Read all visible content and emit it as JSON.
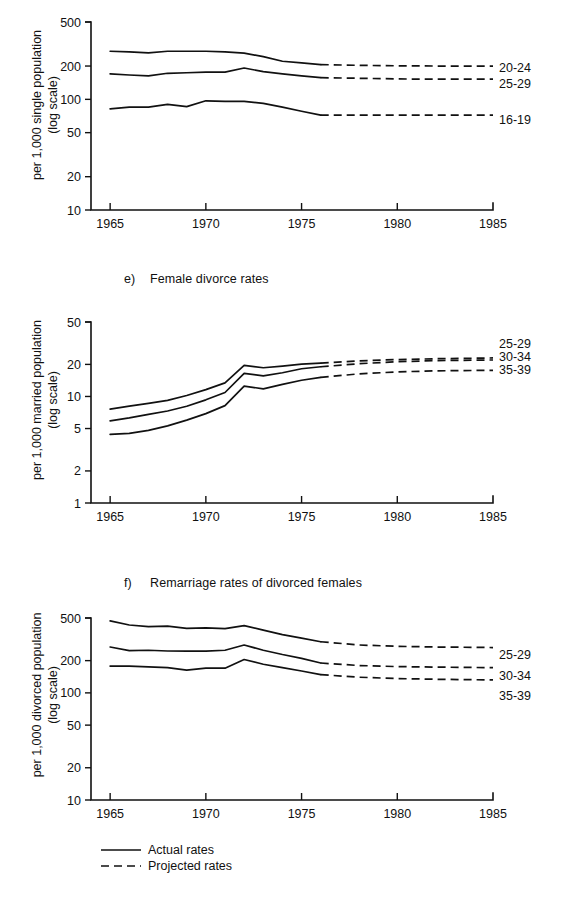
{
  "figure": {
    "background": "#ffffff",
    "ink_color": "#111111"
  },
  "panels": [
    {
      "marker": "",
      "title": "",
      "ylabel_line1": "per 1,000 single population",
      "ylabel_line2": "(log scale)"
    },
    {
      "marker": "e)",
      "title": "Female divorce rates",
      "ylabel_line1": "per 1,000 married population",
      "ylabel_line2": "(log scale)"
    },
    {
      "marker": "f)",
      "title": "Remarriage rates of divorced females",
      "ylabel_line1": "per 1,000 divorced population",
      "ylabel_line2": "(log scale)"
    }
  ],
  "legend": {
    "items": [
      {
        "label": "Actual rates",
        "style": "solid"
      },
      {
        "label": "Projected rates",
        "style": "dashed"
      }
    ]
  },
  "chart_data": [
    {
      "type": "line",
      "title": "",
      "xlabel": "",
      "ylabel": "per 1,000 single population (log scale)",
      "log_y": true,
      "ylim": [
        10,
        500
      ],
      "yticks": [
        10,
        20,
        50,
        100,
        200,
        500
      ],
      "ytick_labels": [
        "10",
        "20",
        "50",
        "100",
        "200",
        "500"
      ],
      "xlim": [
        1964,
        1985
      ],
      "xticks": [
        1965,
        1970,
        1975,
        1980,
        1985
      ],
      "xtick_labels": [
        "1965",
        "1970",
        "1975",
        "1980",
        "1985"
      ],
      "grid": false,
      "legend_position": "right-of-series",
      "split_year": 1976,
      "series": [
        {
          "name": "20-24",
          "x": [
            1965,
            1966,
            1967,
            1968,
            1969,
            1970,
            1971,
            1972,
            1973,
            1974,
            1975,
            1976
          ],
          "values": [
            272,
            268,
            263,
            272,
            272,
            272,
            268,
            262,
            243,
            221,
            214,
            206
          ],
          "projected_x": [
            1976,
            1978,
            1980,
            1982,
            1985
          ],
          "projected_values": [
            206,
            203,
            201,
            200,
            200
          ]
        },
        {
          "name": "25-29",
          "x": [
            1965,
            1966,
            1967,
            1968,
            1969,
            1970,
            1971,
            1972,
            1973,
            1974,
            1975,
            1976
          ],
          "values": [
            170,
            166,
            163,
            172,
            174,
            176,
            176,
            192,
            178,
            170,
            163,
            157
          ],
          "projected_x": [
            1976,
            1978,
            1980,
            1982,
            1985
          ],
          "projected_values": [
            157,
            155,
            153,
            152,
            152
          ]
        },
        {
          "name": "16-19",
          "x": [
            1965,
            1966,
            1967,
            1968,
            1969,
            1970,
            1971,
            1972,
            1973,
            1974,
            1975,
            1976
          ],
          "values": [
            82,
            85,
            85,
            90,
            86,
            97,
            96,
            96,
            92,
            85,
            78,
            72
          ],
          "projected_x": [
            1976,
            1978,
            1980,
            1982,
            1985
          ],
          "projected_values": [
            72,
            72,
            72,
            72,
            72
          ]
        }
      ]
    },
    {
      "type": "line",
      "title": "e) Female divorce rates",
      "xlabel": "",
      "ylabel": "per 1,000 married population (log scale)",
      "log_y": true,
      "ylim": [
        1,
        50
      ],
      "yticks": [
        1,
        2,
        5,
        10,
        20,
        50
      ],
      "ytick_labels": [
        "1",
        "2",
        "5",
        "10",
        "20",
        "50"
      ],
      "xlim": [
        1964,
        1985
      ],
      "xticks": [
        1965,
        1970,
        1975,
        1980,
        1985
      ],
      "xtick_labels": [
        "1965",
        "1970",
        "1975",
        "1980",
        "1985"
      ],
      "grid": false,
      "legend_position": "right-of-series",
      "split_year": 1976,
      "series": [
        {
          "name": "25-29",
          "x": [
            1965,
            1966,
            1967,
            1968,
            1969,
            1970,
            1971,
            1972,
            1973,
            1974,
            1975,
            1976
          ],
          "values": [
            7.6,
            8.1,
            8.6,
            9.2,
            10.2,
            11.6,
            13.4,
            19.6,
            18.6,
            19.3,
            20.1,
            20.6
          ],
          "projected_x": [
            1976,
            1978,
            1980,
            1982,
            1985
          ],
          "projected_values": [
            20.6,
            21.6,
            22.2,
            22.6,
            23.0
          ]
        },
        {
          "name": "30-34",
          "x": [
            1965,
            1966,
            1967,
            1968,
            1969,
            1970,
            1971,
            1972,
            1973,
            1974,
            1975,
            1976
          ],
          "values": [
            5.9,
            6.3,
            6.8,
            7.3,
            8.1,
            9.3,
            10.9,
            16.5,
            15.6,
            16.7,
            18.2,
            19.0
          ],
          "projected_x": [
            1976,
            1978,
            1980,
            1982,
            1985
          ],
          "projected_values": [
            19.0,
            20.3,
            21.2,
            21.7,
            22.0
          ]
        },
        {
          "name": "35-39",
          "x": [
            1965,
            1966,
            1967,
            1968,
            1969,
            1970,
            1971,
            1972,
            1973,
            1974,
            1975,
            1976
          ],
          "values": [
            4.4,
            4.5,
            4.8,
            5.3,
            6.0,
            6.9,
            8.2,
            12.5,
            11.8,
            13.0,
            14.2,
            15.1
          ],
          "projected_x": [
            1976,
            1978,
            1980,
            1982,
            1985
          ],
          "projected_values": [
            15.1,
            16.3,
            17.0,
            17.4,
            17.6
          ]
        }
      ]
    },
    {
      "type": "line",
      "title": "f) Remarriage rates of divorced females",
      "xlabel": "",
      "ylabel": "per 1,000 divorced population (log scale)",
      "log_y": true,
      "ylim": [
        10,
        500
      ],
      "yticks": [
        10,
        20,
        50,
        100,
        200,
        500
      ],
      "ytick_labels": [
        "10",
        "20",
        "50",
        "100",
        "200",
        "500"
      ],
      "xlim": [
        1964,
        1985
      ],
      "xticks": [
        1965,
        1970,
        1975,
        1980,
        1985
      ],
      "xtick_labels": [
        "1965",
        "1970",
        "1975",
        "1980",
        "1985"
      ],
      "grid": false,
      "legend_position": "right-of-series",
      "split_year": 1976,
      "series": [
        {
          "name": "25-29",
          "x": [
            1965,
            1966,
            1967,
            1968,
            1969,
            1970,
            1971,
            1972,
            1973,
            1974,
            1975,
            1976
          ],
          "values": [
            470,
            430,
            415,
            420,
            400,
            405,
            398,
            425,
            385,
            350,
            325,
            300
          ],
          "projected_x": [
            1976,
            1978,
            1980,
            1982,
            1985
          ],
          "projected_values": [
            300,
            280,
            272,
            268,
            265
          ]
        },
        {
          "name": "30-34",
          "x": [
            1965,
            1966,
            1967,
            1968,
            1969,
            1970,
            1971,
            1972,
            1973,
            1974,
            1975,
            1976
          ],
          "values": [
            268,
            248,
            250,
            246,
            245,
            245,
            250,
            280,
            250,
            228,
            210,
            190
          ],
          "projected_x": [
            1976,
            1978,
            1980,
            1982,
            1985
          ],
          "projected_values": [
            190,
            180,
            176,
            174,
            172
          ]
        },
        {
          "name": "35-39",
          "x": [
            1965,
            1966,
            1967,
            1968,
            1969,
            1970,
            1971,
            1972,
            1973,
            1974,
            1975,
            1976
          ],
          "values": [
            178,
            178,
            175,
            172,
            163,
            170,
            170,
            205,
            185,
            172,
            160,
            148
          ],
          "projected_x": [
            1976,
            1978,
            1980,
            1982,
            1985
          ],
          "projected_values": [
            148,
            140,
            136,
            134,
            132
          ]
        }
      ]
    }
  ]
}
